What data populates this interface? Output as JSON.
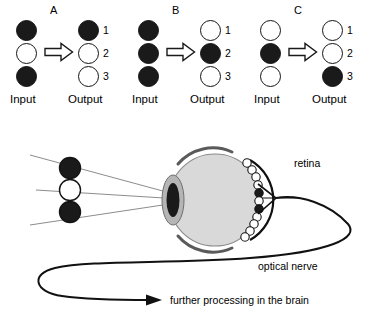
{
  "panels": [
    {
      "label": "A",
      "input_label": "Input",
      "output_label": "Output",
      "input": [
        "filled",
        "empty",
        "filled"
      ],
      "output": [
        "filled",
        "empty",
        "empty"
      ],
      "output_numbers": [
        "1",
        "2",
        "3"
      ],
      "arrow": "block-arrow-right"
    },
    {
      "label": "B",
      "input_label": "Input",
      "output_label": "Output",
      "input": [
        "filled",
        "filled",
        "filled"
      ],
      "output": [
        "empty",
        "filled",
        "empty"
      ],
      "output_numbers": [
        "1",
        "2",
        "3"
      ],
      "arrow": "block-arrow-right"
    },
    {
      "label": "C",
      "input_label": "Input",
      "output_label": "Output",
      "input": [
        "empty",
        "filled",
        "empty"
      ],
      "output": [
        "empty",
        "empty",
        "filled"
      ],
      "output_numbers": [
        "1",
        "2",
        "3"
      ],
      "arrow": "block-arrow-right"
    }
  ],
  "eye_scene": {
    "stimulus": [
      "filled",
      "empty",
      "filled"
    ],
    "retina_label": "retina",
    "optical_nerve_label": "optical nerve",
    "brain_label": "further processing in the brain",
    "retina_cells": [
      "empty",
      "empty",
      "empty",
      "empty",
      "empty",
      "filled",
      "empty",
      "filled",
      "empty",
      "empty",
      "empty",
      "empty"
    ],
    "ray_count": 3
  },
  "colors": {
    "ink": "#000000",
    "dot_fill": "#1a1a1a",
    "dot_empty": "#ffffff",
    "eyeball_fill": "#d9d9d9",
    "eyeball_stroke": "#8a8a8a",
    "sclera_arc": "#5a5a5a",
    "lens_halo": "#b5b5b5",
    "lens_core": "#1a1a1a",
    "ray": "#6e6e6e",
    "background": "#ffffff"
  }
}
